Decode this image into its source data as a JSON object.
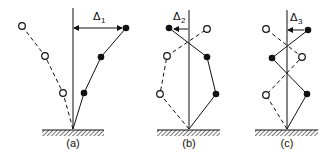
{
  "figure": {
    "colors": {
      "ink": "#111111",
      "background": "#ffffff"
    },
    "panels": [
      {
        "id": "a",
        "caption": "(a)",
        "delta_symbol": "Δ",
        "delta_subscript": "1",
        "arrow_direction": "right",
        "solid_offsets": [
          0.27,
          0.76,
          1.0
        ],
        "dashed_offsets": [
          -0.27,
          -0.76,
          -1.0
        ]
      },
      {
        "id": "b",
        "caption": "(b)",
        "delta_symbol": "Δ",
        "delta_subscript": "2",
        "arrow_direction": "left",
        "solid_offsets": [
          1.35,
          0.9,
          -1.0
        ],
        "dashed_offsets": [
          -1.35,
          -1.1,
          0.9
        ]
      },
      {
        "id": "c",
        "caption": "(c)",
        "delta_symbol": "Δ",
        "delta_subscript": "3",
        "arrow_direction": "right",
        "solid_offsets": [
          1.0,
          -0.7,
          1.0
        ],
        "dashed_offsets": [
          -1.0,
          0.7,
          -1.0
        ]
      }
    ]
  }
}
